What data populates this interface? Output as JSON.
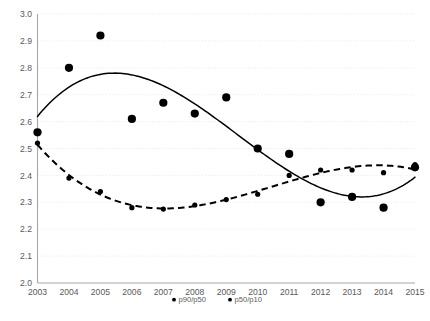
{
  "chart_data": {
    "type": "scatter",
    "title": "",
    "subtitle": "",
    "xlabel": "",
    "ylabel": "",
    "x": [
      2003,
      2004,
      2005,
      2006,
      2007,
      2008,
      2009,
      2010,
      2011,
      2012,
      2013,
      2014,
      2015
    ],
    "categories": [
      "2003",
      "2004",
      "2005",
      "2006",
      "2007",
      "2008",
      "2009",
      "2010",
      "2011",
      "2012",
      "2013",
      "2014",
      "2015"
    ],
    "xlim": [
      2003,
      2015
    ],
    "ylim": [
      2.0,
      3.0
    ],
    "ytick_labels": [
      "2.0",
      "2.1",
      "2.2",
      "2.3",
      "2.4",
      "2.5",
      "2.6",
      "2.7",
      "2.8",
      "2.9",
      "3.0"
    ],
    "ytick_values": [
      2.0,
      2.1,
      2.2,
      2.3,
      2.4,
      2.5,
      2.6,
      2.7,
      2.8,
      2.9,
      3.0
    ],
    "xtick_labels": [
      "2003",
      "2004",
      "2005",
      "2006",
      "2007",
      "2008",
      "2009",
      "2010",
      "2011",
      "2012",
      "2013",
      "2014",
      "2015"
    ],
    "grid": true,
    "grid_axis": "y",
    "legend_position": "bottom",
    "series": [
      {
        "name": "p90/p50",
        "marker": "circle",
        "marker_size": 4.1,
        "line_style": "solid",
        "color": "#000000",
        "values": [
          2.56,
          2.8,
          2.92,
          2.61,
          2.67,
          2.63,
          2.69,
          2.5,
          2.48,
          2.3,
          2.32,
          2.28,
          2.43
        ],
        "trendline": "polynomial-cubic"
      },
      {
        "name": "p50/p10",
        "marker": "circle",
        "marker_size": 2.6,
        "line_style": "dashed",
        "color": "#000000",
        "values": [
          2.52,
          2.39,
          2.34,
          2.28,
          2.275,
          2.29,
          2.31,
          2.33,
          2.4,
          2.42,
          2.42,
          2.41,
          2.44
        ],
        "trendline": "polynomial-cubic"
      }
    ]
  },
  "legend": {
    "items": [
      {
        "label": "p90/p50",
        "marker": "dot"
      },
      {
        "label": "p50/p10",
        "marker": "dot"
      }
    ]
  },
  "colors": {
    "series": "#000000",
    "gridline": "#e8e8e8",
    "axis": "#a6a6a6",
    "tick_text": "#595959",
    "background": "#ffffff"
  }
}
